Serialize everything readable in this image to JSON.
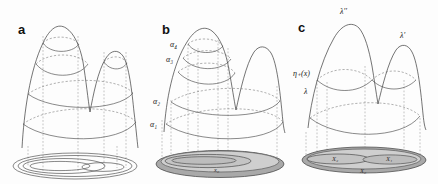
{
  "figure": {
    "panels": [
      {
        "id": "a",
        "letter": "a",
        "description": "two-peaked surface with four level-set contours projected to an unshaded nested-ellipse base",
        "contour_count": 4,
        "base_style": "outline",
        "labels": []
      },
      {
        "id": "b",
        "letter": "b",
        "description": "two-peaked surface with level sets labelled by increasing heights alpha-1 to alpha-4 projected to a shaded base disk",
        "contour_count": 4,
        "base_style": "shaded",
        "labels": [
          {
            "name": "alpha-4",
            "text": "α₄"
          },
          {
            "name": "alpha-3",
            "text": "α₃"
          },
          {
            "name": "alpha-2",
            "text": "α₂"
          },
          {
            "name": "alpha-1",
            "text": "α₁"
          },
          {
            "name": "x-zero",
            "text": "x₀"
          }
        ]
      },
      {
        "id": "c",
        "letter": "c",
        "description": "two-peaked surface with peak values lambda-double-prime and lambda-prime, level sets eta-plus-of-x and lambda, projected to a shaded base disk partitioned into X2, X0, X1",
        "contour_count": 2,
        "base_style": "shaded-partitioned",
        "labels": [
          {
            "name": "lambda-double-prime",
            "text": "λ′′"
          },
          {
            "name": "lambda-prime",
            "text": "λ′"
          },
          {
            "name": "eta-plus-of-x",
            "text": "η₊(x)"
          },
          {
            "name": "lambda",
            "text": "λ"
          },
          {
            "name": "region-x2",
            "text": "X₂"
          },
          {
            "name": "region-x1",
            "text": "X₁"
          },
          {
            "name": "region-x0",
            "text": "X₀"
          }
        ]
      }
    ],
    "colors": {
      "background": "#fdfdfd",
      "surface_stroke": "#3a3a3a",
      "contour_front": "#4a4a4a",
      "contour_back": "#6f6f6f",
      "projection": "#8a8a8a",
      "base_fill_dark": "#a9a9a9",
      "base_fill_light": "#cfcfcf"
    }
  }
}
